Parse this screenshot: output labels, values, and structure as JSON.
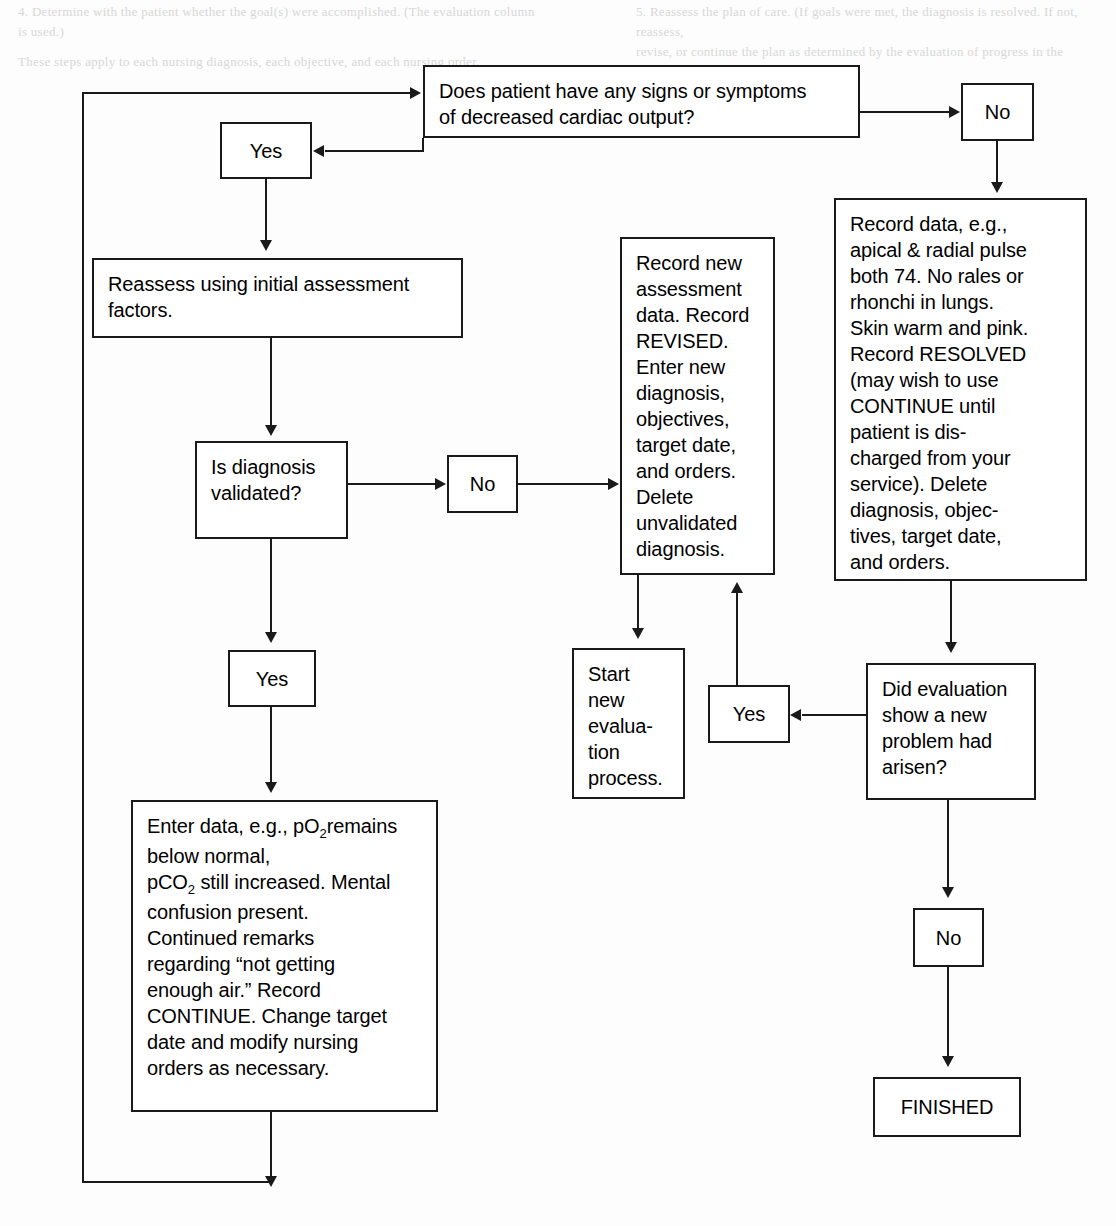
{
  "diagram": {
    "type": "flowchart",
    "line_color": "#1a1a1a",
    "background_color": "#ffffff",
    "nodes": {
      "question_cardiac_output": "Does patient have any signs or symptoms\nof decreased cardiac output?",
      "yes_top": "Yes",
      "no_top": "No",
      "reassess": "Reassess using initial assessment\nfactors.",
      "question_validated": "Is diagnosis\nvalidated?",
      "no_validated": "No",
      "yes_validated": "Yes",
      "record_new_assessment": "Record new\nassessment\ndata. Record\nREVISED.\nEnter new\ndiagnosis,\nobjectives,\ntarget date,\nand orders.\nDelete\nunvalidated\ndiagnosis.",
      "record_data_resolved": "Record data, e.g.,\napical & radial pulse\nboth 74. No rales or\nrhonchi in lungs.\nSkin warm and pink.\nRecord RESOLVED\n(may wish to use\nCONTINUE until\npatient is dis-\ncharged from your\nservice). Delete\ndiagnosis, objec-\ntives, target date,\nand orders.",
      "start_new_evaluation": "Start\nnew\nevalua-\ntion\nprocess.",
      "yes_new_problem": "Yes",
      "question_new_problem": "Did evaluation\nshow a new\nproblem had\narisen?",
      "no_new_problem": "No",
      "finished": "FINISHED",
      "enter_data_continue_line1": "Enter data, e.g., pO",
      "enter_data_continue_sub1": "2",
      "enter_data_continue_line2": "remains below normal,\npCO",
      "enter_data_continue_sub2": "2",
      "enter_data_continue_line3": " still increased. Mental\nconfusion present.\nContinued remarks\nregarding “not getting\nenough air.” Record\nCONTINUE. Change target\ndate and modify nursing\norders as necessary."
    },
    "bleed_through": {
      "top_left": "4. Determine with the patient whether the goal(s) were accomplished. (The evaluation column\n    is used.)",
      "top_right": "5. Reassess the plan of care. (If goals were met, the diagnosis is resolved. If not, reassess,\n    revise, or continue the plan as determined by the evaluation of progress in the\n    evaluation column.)",
      "line_three": "These steps apply to each nursing diagnosis, each objective, and each nursing order."
    }
  }
}
